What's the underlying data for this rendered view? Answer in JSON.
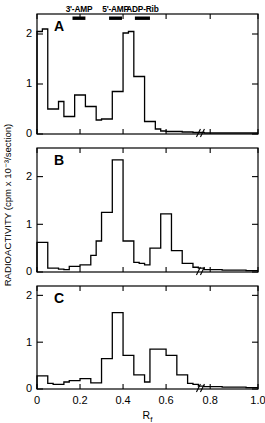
{
  "figure": {
    "ylabel": "RADIOACTIVITY (cpm x 10⁻³/section)",
    "xlabel_base": "R",
    "xlabel_sub": "f",
    "axis_break_symbol": "//"
  },
  "markers": [
    {
      "name": "3'-AMP",
      "rf_start": 0.165,
      "rf_end": 0.225
    },
    {
      "name": "5'-AMP",
      "rf_start": 0.335,
      "rf_end": 0.395
    },
    {
      "name": "ADP-Rib",
      "rf_start": 0.455,
      "rf_end": 0.525
    }
  ],
  "xticks": [
    "0",
    "0.2",
    "0.4",
    "0.6",
    "0.8",
    "1.0"
  ],
  "xtick_values": [
    0,
    0.2,
    0.4,
    0.6,
    0.8,
    1.0
  ],
  "yticks": [
    "0",
    "1",
    "2"
  ],
  "ytick_values": [
    0,
    1,
    2
  ],
  "chart_data": {
    "type": "line",
    "title": "",
    "xlabel": "Rf",
    "ylabel": "RADIOACTIVITY (cpm x 10-3/section)",
    "xlim": [
      0,
      1.0
    ],
    "ylim": [
      0,
      2.4
    ],
    "grid": false,
    "legend": "none",
    "step_style": "post",
    "bin_width": 0.025,
    "axis_break_at": 0.755,
    "panels": [
      {
        "label": "A",
        "ylim": [
          0,
          2.4
        ],
        "yticks": [
          0,
          1,
          2
        ],
        "x": [
          0.0,
          0.025,
          0.05,
          0.075,
          0.1,
          0.125,
          0.15,
          0.175,
          0.2,
          0.225,
          0.25,
          0.275,
          0.3,
          0.325,
          0.35,
          0.375,
          0.4,
          0.425,
          0.45,
          0.475,
          0.5,
          0.525,
          0.55,
          0.575,
          0.6,
          0.625,
          0.65,
          0.675,
          0.7,
          0.725,
          0.75,
          0.775,
          0.8,
          0.85,
          0.9,
          0.95,
          1.0
        ],
        "values": [
          2.05,
          2.1,
          0.5,
          0.5,
          0.65,
          0.35,
          0.35,
          0.78,
          0.78,
          0.55,
          0.55,
          0.28,
          0.3,
          0.3,
          0.85,
          0.85,
          2.02,
          2.05,
          1.15,
          1.15,
          0.25,
          0.25,
          0.1,
          0.06,
          0.05,
          0.05,
          0.05,
          0.04,
          0.04,
          0.03,
          0.03,
          0.02,
          0.02,
          0.02,
          0.02,
          0.02,
          0.02
        ]
      },
      {
        "label": "B",
        "ylim": [
          0,
          2.6
        ],
        "yticks": [
          0,
          1,
          2
        ],
        "x": [
          0.0,
          0.025,
          0.05,
          0.075,
          0.1,
          0.125,
          0.15,
          0.175,
          0.2,
          0.225,
          0.25,
          0.275,
          0.3,
          0.325,
          0.35,
          0.375,
          0.4,
          0.425,
          0.45,
          0.475,
          0.5,
          0.525,
          0.55,
          0.575,
          0.6,
          0.625,
          0.65,
          0.675,
          0.7,
          0.725,
          0.75,
          0.775,
          0.8,
          0.85,
          0.9,
          0.95,
          1.0
        ],
        "values": [
          0.62,
          0.62,
          0.08,
          0.08,
          0.06,
          0.05,
          0.12,
          0.12,
          0.15,
          0.15,
          0.35,
          0.65,
          1.25,
          1.25,
          2.35,
          2.35,
          0.65,
          0.65,
          0.2,
          0.18,
          0.15,
          0.5,
          0.5,
          1.22,
          1.22,
          0.45,
          0.45,
          0.18,
          0.18,
          0.1,
          0.08,
          0.05,
          0.05,
          0.04,
          0.04,
          0.03,
          0.03
        ]
      },
      {
        "label": "C",
        "ylim": [
          0,
          2.2
        ],
        "yticks": [
          0,
          1,
          2
        ],
        "x": [
          0.0,
          0.025,
          0.05,
          0.075,
          0.1,
          0.125,
          0.15,
          0.175,
          0.2,
          0.225,
          0.25,
          0.275,
          0.3,
          0.325,
          0.35,
          0.375,
          0.4,
          0.425,
          0.45,
          0.475,
          0.5,
          0.525,
          0.55,
          0.575,
          0.6,
          0.625,
          0.65,
          0.675,
          0.7,
          0.725,
          0.75,
          0.775,
          0.8,
          0.85,
          0.9,
          0.95,
          1.0
        ],
        "values": [
          0.28,
          0.28,
          0.12,
          0.1,
          0.1,
          0.15,
          0.18,
          0.18,
          0.22,
          0.22,
          0.13,
          0.13,
          0.65,
          0.65,
          1.63,
          1.63,
          0.72,
          0.72,
          0.3,
          0.3,
          0.15,
          0.85,
          0.85,
          0.85,
          0.72,
          0.72,
          0.3,
          0.3,
          0.12,
          0.1,
          0.06,
          0.05,
          0.05,
          0.04,
          0.04,
          0.03,
          0.03
        ]
      }
    ]
  }
}
